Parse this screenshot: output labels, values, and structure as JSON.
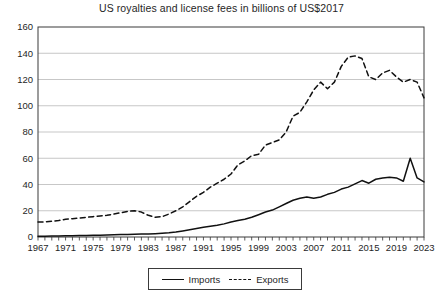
{
  "chart_data": {
    "type": "line",
    "title": "US royalties and license fees in billions of US$2017",
    "xlabel": "",
    "ylabel": "",
    "xlim": [
      1967,
      2023
    ],
    "ylim": [
      0,
      160
    ],
    "ytick_step": 20,
    "xtick_step_labels": 4,
    "xtick_step_minor": 1,
    "grid": "horizontal",
    "legend_position": "bottom-center",
    "yticks": [
      0,
      20,
      40,
      60,
      80,
      100,
      120,
      140,
      160
    ],
    "ytick_labels": [
      "0",
      "20",
      "40",
      "60",
      "80",
      "100",
      "120",
      "140",
      "160"
    ],
    "xticks": [
      1967,
      1971,
      1975,
      1979,
      1983,
      1987,
      1991,
      1995,
      1999,
      2003,
      2007,
      2011,
      2015,
      2019,
      2023
    ],
    "xtick_labels": [
      "1967",
      "1971",
      "1975",
      "1979",
      "1983",
      "1987",
      "1991",
      "1995",
      "1999",
      "2003",
      "2007",
      "2011",
      "2015",
      "2019",
      "2023"
    ],
    "x": [
      1967,
      1968,
      1969,
      1970,
      1971,
      1972,
      1973,
      1974,
      1975,
      1976,
      1977,
      1978,
      1979,
      1980,
      1981,
      1982,
      1983,
      1984,
      1985,
      1986,
      1987,
      1988,
      1989,
      1990,
      1991,
      1992,
      1993,
      1994,
      1995,
      1996,
      1997,
      1998,
      1999,
      2000,
      2001,
      2002,
      2003,
      2004,
      2005,
      2006,
      2007,
      2008,
      2009,
      2010,
      2011,
      2012,
      2013,
      2014,
      2015,
      2016,
      2017,
      2018,
      2019,
      2020,
      2021,
      2022,
      2023
    ],
    "series": [
      {
        "name": "Imports",
        "style": "solid",
        "color": "#111111",
        "values": [
          0.5,
          0.6,
          0.7,
          0.8,
          0.9,
          1.0,
          1.1,
          1.2,
          1.3,
          1.4,
          1.5,
          1.7,
          1.9,
          2.0,
          2.1,
          2.2,
          2.3,
          2.5,
          2.8,
          3.2,
          3.8,
          4.6,
          5.5,
          6.5,
          7.5,
          8.2,
          9.0,
          10.0,
          11.5,
          12.5,
          13.5,
          15.0,
          17.0,
          19.0,
          20.5,
          23.0,
          25.5,
          28.0,
          29.5,
          30.5,
          29.5,
          30.5,
          32.5,
          34.0,
          36.5,
          38.0,
          40.5,
          43.0,
          41.0,
          44.0,
          45.0,
          45.5,
          45.0,
          42.5,
          60.0,
          45.0,
          42.0
        ]
      },
      {
        "name": "Exports",
        "style": "dashed",
        "color": "#111111",
        "values": [
          11.5,
          11.5,
          12.0,
          12.5,
          13.5,
          14.0,
          14.5,
          15.0,
          15.5,
          16.0,
          16.5,
          17.5,
          18.5,
          19.5,
          20.0,
          19.0,
          16.5,
          15.0,
          15.5,
          17.5,
          20.0,
          23.0,
          27.0,
          31.0,
          34.0,
          38.0,
          41.0,
          44.0,
          48.0,
          55.0,
          58.0,
          62.0,
          63.0,
          70.0,
          72.0,
          74.0,
          80.0,
          92.0,
          95.0,
          103.0,
          112.0,
          118.0,
          113.0,
          118.0,
          130.0,
          137.0,
          138.0,
          136.0,
          122.0,
          120.0,
          125.0,
          127.0,
          122.0,
          118.0,
          120.0,
          118.0,
          106.0
        ]
      }
    ]
  },
  "legend": {
    "imports_label": "Imports",
    "exports_label": "Exports"
  },
  "bleed_through": {
    "line1": "",
    "line2": ""
  }
}
